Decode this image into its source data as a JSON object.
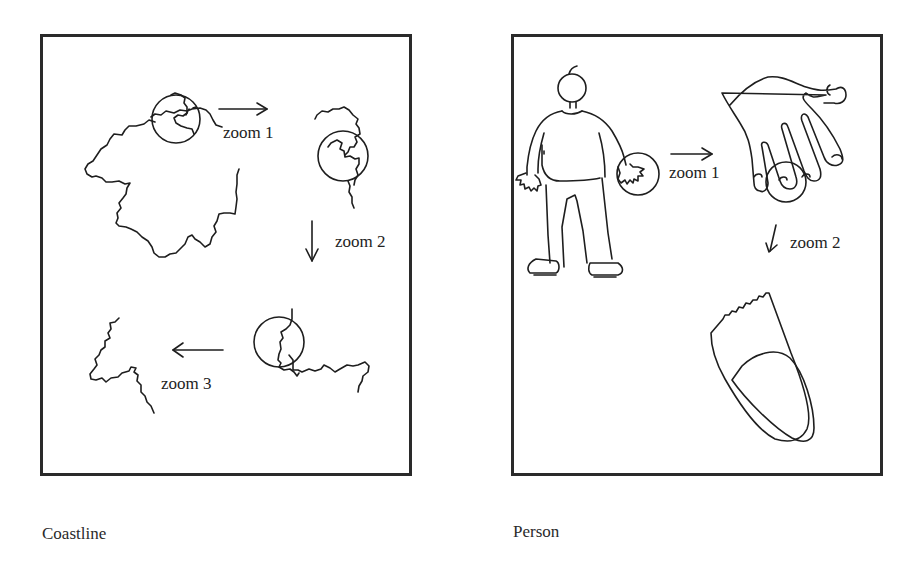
{
  "figure": {
    "panels": [
      {
        "caption": "Coastline",
        "steps": [
          {
            "label": "zoom 1",
            "arrow": "right"
          },
          {
            "label": "zoom 2",
            "arrow": "down"
          },
          {
            "label": "zoom 3",
            "arrow": "left"
          }
        ]
      },
      {
        "caption": "Person",
        "steps": [
          {
            "label": "zoom 1",
            "arrow": "right"
          },
          {
            "label": "zoom 2",
            "arrow": "down"
          }
        ]
      }
    ]
  }
}
